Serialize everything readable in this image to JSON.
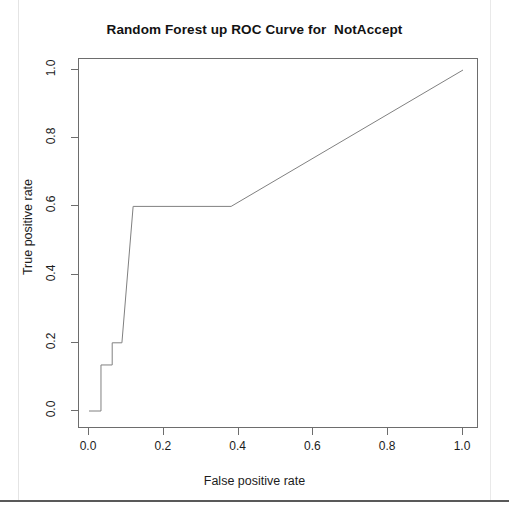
{
  "chart_data": {
    "type": "line",
    "title": "Random Forest up ROC Curve for  NotAccept",
    "xlabel": "False positive rate",
    "ylabel": "True positive rate",
    "xlim": [
      0.0,
      1.0
    ],
    "ylim": [
      0.0,
      1.0
    ],
    "xticks": [
      "0.0",
      "0.2",
      "0.4",
      "0.6",
      "0.8",
      "1.0"
    ],
    "xtick_values": [
      0.0,
      0.2,
      0.4,
      0.6,
      0.8,
      1.0
    ],
    "yticks": [
      "0.0",
      "0.2",
      "0.4",
      "0.6",
      "0.8",
      "1.0"
    ],
    "ytick_values": [
      0.0,
      0.2,
      0.4,
      0.6,
      0.8,
      1.0
    ],
    "grid": false,
    "legend": "none",
    "series": [
      {
        "name": "ROC curve",
        "color": "#808080",
        "line_width": 1,
        "x": [
          0.0,
          0.032,
          0.032,
          0.062,
          0.062,
          0.088,
          0.118,
          0.38,
          1.0
        ],
        "y": [
          0.0,
          0.0,
          0.135,
          0.135,
          0.2,
          0.2,
          0.6,
          0.6,
          1.0
        ]
      }
    ]
  },
  "page": {
    "rule_color": "#595959",
    "background": "#ffffff",
    "axis_color": "#6d6d6d"
  }
}
